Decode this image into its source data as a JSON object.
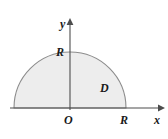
{
  "figure": {
    "type": "math-diagram",
    "background_color": "#ffffff",
    "canvas": {
      "width": 168,
      "height": 139
    }
  },
  "axes": {
    "x_axis": {
      "label": "x",
      "color": "#4d4d4d",
      "start_x": 10,
      "end_x": 162,
      "y": 108,
      "arrow": "right"
    },
    "y_axis": {
      "label": "y",
      "color": "#4d4d4d",
      "x": 70,
      "start_y": 108,
      "end_y": 20,
      "arrow": "up"
    },
    "origin_label": "O"
  },
  "ticks": {
    "y_tick_label": "R",
    "x_tick_label": "R"
  },
  "region": {
    "label": "D",
    "shape": "semicircle",
    "center": {
      "x": 70,
      "y": 108
    },
    "radius": 56,
    "fill_color": "#ededed",
    "stroke_color": "#8c8c8c"
  }
}
